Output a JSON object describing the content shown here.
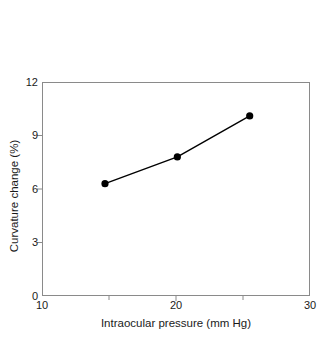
{
  "chart_data": {
    "type": "line",
    "title": "",
    "subtitle": "",
    "xlabel": "Intraocular pressure (mm Hg)",
    "ylabel": "Curvature change (%)",
    "x": [
      14.7,
      20.1,
      25.5
    ],
    "values": [
      6.3,
      7.8,
      10.1
    ],
    "series": [
      {
        "name": "Curvature change",
        "x": [
          14.7,
          20.1,
          25.5
        ],
        "values": [
          6.3,
          7.8,
          10.1
        ]
      }
    ],
    "xlim": [
      10,
      30
    ],
    "ylim": [
      0,
      12
    ],
    "xticks": [
      10,
      20,
      30
    ],
    "xtick_labels": [
      "10",
      "20",
      "30"
    ],
    "x_minor_ticks": [
      15,
      25
    ],
    "yticks": [
      0,
      3,
      6,
      9,
      12
    ],
    "ytick_labels": [
      "0",
      "3",
      "6",
      "9",
      "12"
    ],
    "grid": false,
    "legend": false,
    "legend_position": "none",
    "marker": "filled-circle",
    "line_color": "#000000",
    "marker_color": "#000000",
    "frame_color": "#8a8a8a",
    "background_color": "#ffffff",
    "annotations": []
  },
  "axis": {
    "x_title": "Intraocular pressure (mm Hg)",
    "y_title": "Curvature change (%)"
  }
}
